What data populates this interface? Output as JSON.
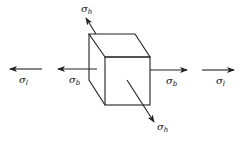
{
  "diagram": {
    "colors": {
      "stroke": "#222222",
      "background": "#ffffff"
    },
    "labels": {
      "sigma_h_top": {
        "symbol": "σ",
        "sub": "h"
      },
      "sigma_h_bottom": {
        "symbol": "σ",
        "sub": "h"
      },
      "sigma_l_left": {
        "symbol": "σ",
        "sub": "l"
      },
      "sigma_b_left": {
        "symbol": "σ",
        "sub": "b"
      },
      "sigma_b_right": {
        "symbol": "σ",
        "sub": "b"
      },
      "sigma_l_right": {
        "symbol": "σ",
        "sub": "l"
      }
    }
  }
}
